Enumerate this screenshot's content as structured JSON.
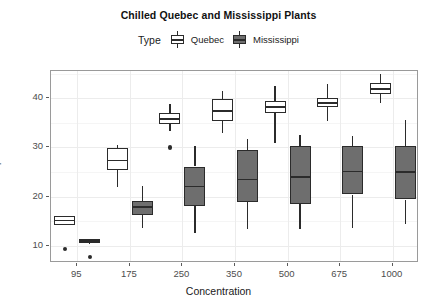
{
  "chart_data": {
    "type": "boxplot",
    "title": "Chilled Quebec and Mississippi Plants",
    "xlabel": "Concentration",
    "ylabel": "Uptake",
    "categories": [
      "95",
      "175",
      "250",
      "350",
      "500",
      "675",
      "1000"
    ],
    "ylim": [
      6.5,
      45.5
    ],
    "yticks": [
      10,
      20,
      30,
      40
    ],
    "grid": true,
    "legend": {
      "title": "Type",
      "position": "top",
      "entries": [
        {
          "name": "Quebec",
          "fill": "#ffffff",
          "stroke": "#2b2b2b"
        },
        {
          "name": "Mississippi",
          "fill": "#6e6e6e",
          "stroke": "#2b2b2b"
        }
      ]
    },
    "series": [
      {
        "name": "Quebec",
        "fill": "#ffffff",
        "boxes": [
          {
            "category": "95",
            "min": 14.2,
            "q1": 14.2,
            "median": 15.1,
            "q3": 16.0,
            "max": 16.0,
            "outliers": [
              9.3
            ]
          },
          {
            "category": "175",
            "min": 22.0,
            "q1": 25.4,
            "median": 27.3,
            "q3": 29.9,
            "max": 30.4,
            "outliers": []
          },
          {
            "category": "250",
            "min": 33.3,
            "q1": 34.8,
            "median": 35.8,
            "q3": 37.0,
            "max": 38.9,
            "outliers": [
              30.0
            ]
          },
          {
            "category": "350",
            "min": 32.8,
            "q1": 35.4,
            "median": 37.4,
            "q3": 39.9,
            "max": 41.4,
            "outliers": []
          },
          {
            "category": "500",
            "min": 30.9,
            "q1": 36.9,
            "median": 38.2,
            "q3": 39.4,
            "max": 42.4,
            "outliers": []
          },
          {
            "category": "675",
            "min": 35.4,
            "q1": 38.2,
            "median": 39.0,
            "q3": 40.0,
            "max": 42.9,
            "outliers": []
          },
          {
            "category": "1000",
            "min": 38.9,
            "q1": 40.9,
            "median": 41.8,
            "q3": 43.1,
            "max": 45.0,
            "outliers": []
          }
        ]
      },
      {
        "name": "Mississippi",
        "fill": "#6e6e6e",
        "boxes": [
          {
            "category": "95",
            "min": 10.5,
            "q1": 10.6,
            "median": 11.0,
            "q3": 11.3,
            "max": 11.4,
            "outliers": [
              7.7
            ]
          },
          {
            "category": "175",
            "min": 13.6,
            "q1": 16.2,
            "median": 17.9,
            "q3": 19.1,
            "max": 22.1,
            "outliers": []
          },
          {
            "category": "250",
            "min": 12.6,
            "q1": 18.1,
            "median": 22.0,
            "q3": 26.1,
            "max": 30.3,
            "outliers": []
          },
          {
            "category": "350",
            "min": 13.4,
            "q1": 18.9,
            "median": 23.5,
            "q3": 29.4,
            "max": 31.6,
            "outliers": []
          },
          {
            "category": "500",
            "min": 13.4,
            "q1": 18.5,
            "median": 24.0,
            "q3": 30.2,
            "max": 32.5,
            "outliers": []
          },
          {
            "category": "675",
            "min": 13.7,
            "q1": 20.4,
            "median": 25.1,
            "q3": 30.3,
            "max": 32.4,
            "outliers": []
          },
          {
            "category": "1000",
            "min": 14.4,
            "q1": 19.4,
            "median": 25.0,
            "q3": 30.3,
            "max": 35.5,
            "outliers": []
          }
        ]
      }
    ]
  }
}
